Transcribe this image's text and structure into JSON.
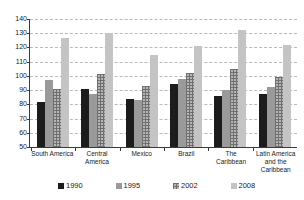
{
  "chart_data": {
    "type": "bar",
    "title": "",
    "subtitle": "",
    "xlabel": "",
    "ylabel": "",
    "ylim": [
      50,
      140
    ],
    "y_ticks": [
      50,
      60,
      70,
      80,
      90,
      100,
      110,
      120,
      130,
      140
    ],
    "grid": true,
    "legend_position": "bottom",
    "categories": [
      "South America",
      "Central America",
      "Mexico",
      "Brazil",
      "The Caribbean",
      "Latin America and the Caribbean"
    ],
    "series": [
      {
        "name": "1990",
        "color": "#1c1c1c",
        "values": [
          82,
          91,
          84,
          94,
          86,
          87
        ]
      },
      {
        "name": "1995",
        "color": "#9a9a9a",
        "values": [
          97,
          87,
          83,
          98,
          90,
          92
        ]
      },
      {
        "name": "2002",
        "color": "#b5b5b5",
        "values": [
          91,
          101,
          93,
          102,
          105,
          99
        ]
      },
      {
        "name": "2008",
        "color": "#c4c4c4",
        "values": [
          127,
          130,
          115,
          121,
          132,
          122
        ]
      }
    ]
  },
  "legend": {
    "items": [
      {
        "label": "1990"
      },
      {
        "label": "1995"
      },
      {
        "label": "2002"
      },
      {
        "label": "2008"
      }
    ]
  }
}
